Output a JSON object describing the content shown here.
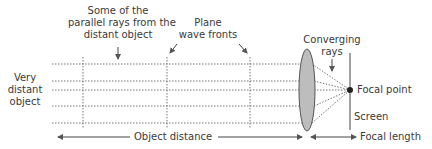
{
  "diagram": {
    "labels": {
      "parallel_rays": [
        "Some of the",
        "parallel rays from the",
        "distant object"
      ],
      "wave_fronts": [
        "Plane",
        "wave fronts"
      ],
      "converging_rays": [
        "Converging",
        "rays"
      ],
      "object": [
        "Very",
        "distant",
        "object"
      ],
      "focal_point": "Focal point",
      "screen": "Screen",
      "object_distance": "Object distance",
      "focal_length": "Focal length"
    },
    "rays_y": [
      64,
      81,
      90,
      106,
      123
    ],
    "wavefronts_x": [
      83,
      167,
      250
    ],
    "lens": {
      "cx": 307,
      "cy": 90,
      "rx": 8,
      "ry": 41,
      "fill": "#bdbdbd",
      "stroke": "#555555"
    },
    "focal_point": {
      "x": 350,
      "y": 90
    },
    "screen": {
      "x": 350,
      "y1": 53,
      "y2": 130
    },
    "colors": {
      "line": "#555555",
      "text": "#3a3a3a",
      "lens": "#bdbdbd"
    }
  }
}
